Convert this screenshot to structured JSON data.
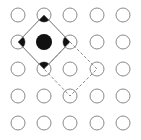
{
  "diagram": {
    "type": "lattice-grid",
    "rows": 5,
    "cols": 5,
    "col_x": [
      18,
      44,
      70,
      97,
      123
    ],
    "row_y": [
      15,
      42,
      69,
      96,
      123
    ],
    "circle_radius": 7,
    "center_radius": 8,
    "colors": {
      "background": "#ffffff",
      "circle_stroke": "#8a8a8a",
      "line": "#6e6e6e",
      "fill": "#111111",
      "dashed": "#8a8a8a"
    },
    "filled_node": {
      "row": 1,
      "col": 1
    },
    "solid_diamond": {
      "vertices": [
        {
          "row": 0,
          "col": 1
        },
        {
          "row": 1,
          "col": 2
        },
        {
          "row": 2,
          "col": 1
        },
        {
          "row": 1,
          "col": 0
        }
      ]
    },
    "dashed_diamond": {
      "vertices": [
        {
          "row": 1,
          "col": 2
        },
        {
          "row": 2,
          "col": 3
        },
        {
          "row": 3,
          "col": 2
        },
        {
          "row": 2,
          "col": 1
        }
      ]
    }
  }
}
